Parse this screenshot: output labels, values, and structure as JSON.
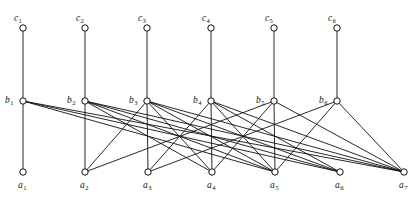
{
  "figure": {
    "width": 419,
    "height": 211,
    "background_color": "#ffffff",
    "stroke_color": "#111111"
  },
  "graph_data": {
    "type": "graph",
    "description": "Three-level vertex diagram: row c on top, row b in middle, row a at bottom, with straight-line edges.",
    "rows": [
      {
        "name": "c-row",
        "y": 28,
        "nodes": [
          {
            "id": "c1",
            "letter": "c",
            "sub": "1",
            "x": 23,
            "label_dx": -9,
            "label_dy": -7
          },
          {
            "id": "c2",
            "letter": "c",
            "sub": "2",
            "x": 85,
            "label_dx": -9,
            "label_dy": -7
          },
          {
            "id": "c3",
            "letter": "c",
            "sub": "3",
            "x": 147,
            "label_dx": -9,
            "label_dy": -7
          },
          {
            "id": "c4",
            "letter": "c",
            "sub": "4",
            "x": 211,
            "label_dx": -9,
            "label_dy": -7
          },
          {
            "id": "c5",
            "letter": "c",
            "sub": "5",
            "x": 274,
            "label_dx": -9,
            "label_dy": -7
          },
          {
            "id": "c6",
            "letter": "c",
            "sub": "6",
            "x": 337,
            "label_dx": -9,
            "label_dy": -7
          }
        ]
      },
      {
        "name": "b-row",
        "y": 101,
        "nodes": [
          {
            "id": "b1",
            "letter": "b",
            "sub": "1",
            "x": 23,
            "label_dx": -18,
            "label_dy": 2
          },
          {
            "id": "b2",
            "letter": "b",
            "sub": "2",
            "x": 85,
            "label_dx": -18,
            "label_dy": 2
          },
          {
            "id": "b3",
            "letter": "b",
            "sub": "3",
            "x": 147,
            "label_dx": -18,
            "label_dy": 2
          },
          {
            "id": "b4",
            "letter": "b",
            "sub": "4",
            "x": 211,
            "label_dx": -18,
            "label_dy": 2
          },
          {
            "id": "b5",
            "letter": "b",
            "sub": "5",
            "x": 274,
            "label_dx": -18,
            "label_dy": 2
          },
          {
            "id": "b6",
            "letter": "b",
            "sub": "6",
            "x": 337,
            "label_dx": -18,
            "label_dy": 2
          }
        ]
      },
      {
        "name": "a-row",
        "y": 172,
        "nodes": [
          {
            "id": "a1",
            "letter": "a",
            "sub": "1",
            "x": 23,
            "label_dx": -5,
            "label_dy": 16
          },
          {
            "id": "a2",
            "letter": "a",
            "sub": "2",
            "x": 85,
            "label_dx": -5,
            "label_dy": 16
          },
          {
            "id": "a3",
            "letter": "a",
            "sub": "3",
            "x": 148,
            "label_dx": -5,
            "label_dy": 16
          },
          {
            "id": "a4",
            "letter": "a",
            "sub": "4",
            "x": 212,
            "label_dx": -5,
            "label_dy": 16
          },
          {
            "id": "a5",
            "letter": "a",
            "sub": "5",
            "x": 275,
            "label_dx": -5,
            "label_dy": 16
          },
          {
            "id": "a6",
            "letter": "a",
            "sub": "6",
            "x": 340,
            "label_dx": -5,
            "label_dy": 16
          },
          {
            "id": "a7",
            "letter": "a",
            "sub": "7",
            "x": 404,
            "label_dx": -5,
            "label_dy": 16
          }
        ]
      }
    ],
    "node_radius": 3.2,
    "edges_cb": [
      {
        "from": "c1",
        "to": "b1"
      },
      {
        "from": "c2",
        "to": "b2"
      },
      {
        "from": "c3",
        "to": "b3"
      },
      {
        "from": "c4",
        "to": "b4"
      },
      {
        "from": "c5",
        "to": "b5"
      },
      {
        "from": "c6",
        "to": "b6"
      }
    ],
    "edges_ba": [
      {
        "from": "b1",
        "to": "a1"
      },
      {
        "from": "b1",
        "to": "a5"
      },
      {
        "from": "b1",
        "to": "a6"
      },
      {
        "from": "b1",
        "to": "a7"
      },
      {
        "from": "b2",
        "to": "a2"
      },
      {
        "from": "b2",
        "to": "a4"
      },
      {
        "from": "b2",
        "to": "a5"
      },
      {
        "from": "b2",
        "to": "a6"
      },
      {
        "from": "b2",
        "to": "a7"
      },
      {
        "from": "b3",
        "to": "a2"
      },
      {
        "from": "b3",
        "to": "a3"
      },
      {
        "from": "b3",
        "to": "a4"
      },
      {
        "from": "b3",
        "to": "a5"
      },
      {
        "from": "b3",
        "to": "a6"
      },
      {
        "from": "b3",
        "to": "a7"
      },
      {
        "from": "b4",
        "to": "a3"
      },
      {
        "from": "b4",
        "to": "a4"
      },
      {
        "from": "b4",
        "to": "a5"
      },
      {
        "from": "b4",
        "to": "a6"
      },
      {
        "from": "b4",
        "to": "a7"
      },
      {
        "from": "b5",
        "to": "a2"
      },
      {
        "from": "b5",
        "to": "a4"
      },
      {
        "from": "b5",
        "to": "a5"
      },
      {
        "from": "b5",
        "to": "a7"
      },
      {
        "from": "b6",
        "to": "a3"
      },
      {
        "from": "b6",
        "to": "a5"
      },
      {
        "from": "b6",
        "to": "a7"
      }
    ]
  }
}
